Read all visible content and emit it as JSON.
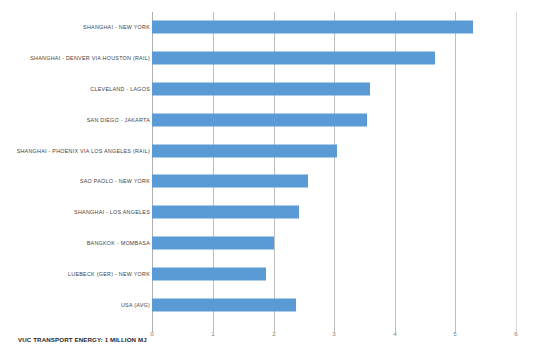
{
  "chart_data": {
    "type": "bar",
    "orientation": "horizontal",
    "title": "",
    "xlabel": "VUC TRANSPORT ENERGY: 1 MILLION MJ",
    "ylabel": "",
    "xlim": [
      0,
      6
    ],
    "xticks": [
      "0",
      "1",
      "2",
      "3",
      "4",
      "5",
      "6"
    ],
    "grid": true,
    "legend": false,
    "bar_color": "#5b9bd5",
    "categories": [
      "SHANGHAI - NEW YORK",
      "SHANGHAI - DENVER VIA HOUSTON (RAIL)",
      "CLEVELAND - LAGOS",
      "SAN DIEGO - JAKARTA",
      "SHANGHAI - PHOENIX VIA LOS ANGELES (RAIL)",
      "SAO PAOLO - NEW YORK",
      "SHANGHAI - LOS ANGELES",
      "BANGKOK - MOMBASA",
      "LUEBECK (GER) - NEW YORK",
      "USA (AVG)"
    ],
    "values": [
      5.3,
      4.67,
      3.6,
      3.55,
      3.05,
      2.58,
      2.43,
      2.02,
      1.88,
      2.38
    ]
  },
  "axis": {
    "x_title": "VUC TRANSPORT ENERGY: 1 MILLION MJ",
    "ticks": [
      "0",
      "1",
      "2",
      "3",
      "4",
      "5",
      "6"
    ]
  }
}
